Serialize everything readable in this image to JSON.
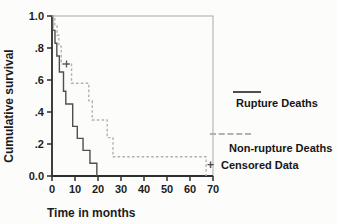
{
  "chart_data": {
    "type": "line",
    "subtype": "kaplan-meier-step",
    "title": "",
    "xlabel": "Time in months",
    "ylabel": "Cumulative survival",
    "xlim": [
      0,
      70
    ],
    "ylim": [
      0.0,
      1.0
    ],
    "grid": false,
    "legend_position": "right-outside",
    "x_ticks": [
      0,
      10,
      20,
      30,
      40,
      50,
      60,
      70
    ],
    "y_ticks": [
      {
        "label": "1.0",
        "value": 1.0
      },
      {
        "label": ".8",
        "value": 0.8
      },
      {
        "label": ".6",
        "value": 0.6
      },
      {
        "label": ".4",
        "value": 0.4
      },
      {
        "label": ".2",
        "value": 0.2
      },
      {
        "label": "0.0",
        "value": 0.0
      }
    ],
    "frame_color": "#a9a9a7",
    "axis_color": "#2e2e2e",
    "series": [
      {
        "name": "Rupture Deaths",
        "line_style": "solid",
        "color": "#4f4f4f",
        "steps": [
          [
            0,
            1.0
          ],
          [
            0.3,
            0.91
          ],
          [
            1.3,
            0.83
          ],
          [
            2.1,
            0.75
          ],
          [
            3.2,
            0.65
          ],
          [
            5.0,
            0.53
          ],
          [
            6.0,
            0.45
          ],
          [
            9.0,
            0.31
          ],
          [
            11.0,
            0.235
          ],
          [
            13.5,
            0.16
          ],
          [
            16.5,
            0.08
          ],
          [
            19.5,
            0.0
          ]
        ]
      },
      {
        "name": "Non-rupture Deaths",
        "line_style": "dashed",
        "color": "#b2b2b2",
        "steps": [
          [
            0,
            1.0
          ],
          [
            1.2,
            0.94
          ],
          [
            2.2,
            0.88
          ],
          [
            3.0,
            0.81
          ],
          [
            4.0,
            0.7
          ],
          [
            8.5,
            0.58
          ],
          [
            16.0,
            0.47
          ],
          [
            17.5,
            0.35
          ],
          [
            24.0,
            0.24
          ],
          [
            26.5,
            0.12
          ],
          [
            67.0,
            0.0
          ]
        ]
      }
    ],
    "censored_points": [
      {
        "x": 6.3,
        "y": 0.7,
        "marker": "+",
        "series": "Non-rupture Deaths"
      }
    ],
    "legend": [
      {
        "label": "Rupture Deaths",
        "sample": "solid-line"
      },
      {
        "label": "Non-rupture Deaths",
        "sample": "dashed-line"
      },
      {
        "label": "Censored Data",
        "sample": "plus-marker",
        "marker": "+"
      }
    ]
  }
}
